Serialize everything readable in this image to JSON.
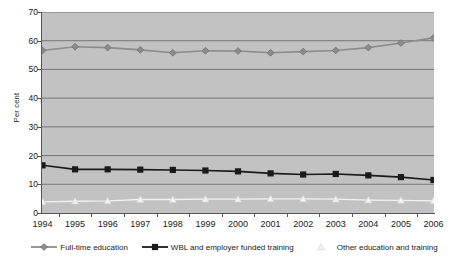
{
  "chart_data": {
    "type": "line",
    "title": "",
    "xlabel": "",
    "ylabel": "Per cent",
    "ylim": [
      0,
      70
    ],
    "ytick_step": 10,
    "grid": true,
    "legend_position": "bottom",
    "categories": [
      "1994",
      "1995",
      "1996",
      "1997",
      "1998",
      "1999",
      "2000",
      "2001",
      "2002",
      "2003",
      "2004",
      "2005",
      "2006"
    ],
    "series": [
      {
        "name": "Full-time education",
        "marker": "diamond",
        "color": "#8c8c8c",
        "values": [
          56.6,
          57.9,
          57.6,
          56.8,
          55.8,
          56.5,
          56.4,
          55.8,
          56.2,
          56.6,
          57.6,
          59.2,
          61.0
        ]
      },
      {
        "name": "WBL and employer funded training",
        "marker": "square",
        "color": "#1a1a1a",
        "values": [
          16.6,
          15.2,
          15.2,
          15.1,
          15.0,
          14.8,
          14.5,
          13.8,
          13.4,
          13.6,
          13.1,
          12.5,
          11.5
        ]
      },
      {
        "name": "Other education and training",
        "marker": "triangle",
        "color": "#f2f2f2",
        "values": [
          3.9,
          4.1,
          4.2,
          4.7,
          4.7,
          4.8,
          4.8,
          4.9,
          4.9,
          4.8,
          4.5,
          4.4,
          4.2
        ]
      }
    ],
    "ytick_labels": [
      "0",
      "10",
      "20",
      "30",
      "40",
      "50",
      "60",
      "70"
    ]
  },
  "legend": {
    "items": [
      {
        "label": "Full-time education"
      },
      {
        "label": "WBL and employer funded training"
      },
      {
        "label": "Other education and training"
      }
    ]
  },
  "colors": {
    "plot_background": "#c2c2c2",
    "gridline": "#6e6e6e",
    "axis": "#555555",
    "page_background": "#ffffff"
  }
}
